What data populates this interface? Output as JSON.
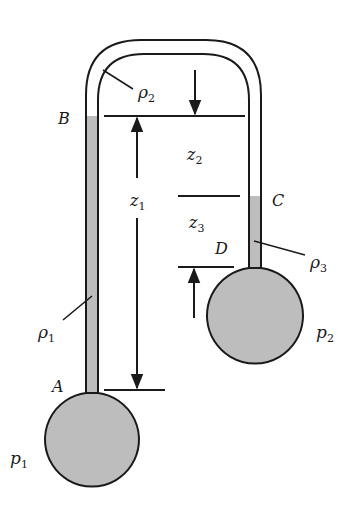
{
  "diagram": {
    "type": "differential manometer",
    "colors": {
      "stroke": "#1a1a1a",
      "fluid_fill": "#bdbdbd",
      "background": "#ffffff"
    },
    "points": {
      "A": "A",
      "B": "B",
      "C": "C",
      "D": "D"
    },
    "densities": {
      "rho1": {
        "symbol": "ρ",
        "sub": "1"
      },
      "rho2": {
        "symbol": "ρ",
        "sub": "2"
      },
      "rho3": {
        "symbol": "ρ",
        "sub": "3"
      }
    },
    "pressures": {
      "p1": {
        "symbol": "p",
        "sub": "1"
      },
      "p2": {
        "symbol": "p",
        "sub": "2"
      }
    },
    "heights": {
      "z1": {
        "symbol": "z",
        "sub": "1"
      },
      "z2": {
        "symbol": "z",
        "sub": "2"
      },
      "z3": {
        "symbol": "z",
        "sub": "3"
      }
    }
  }
}
